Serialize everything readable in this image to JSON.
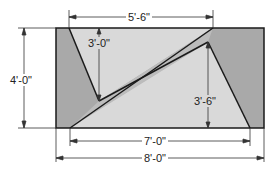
{
  "diagram": {
    "colors": {
      "dark_fill": "#a9a9a9",
      "light_fill": "#d9d9d9",
      "band_fill": "#bcbcbc",
      "line": "#1a1a1a",
      "dim_line": "#333333"
    },
    "dimensions": {
      "top_width": "5'-6\"",
      "left_height": "4'-0\"",
      "inner_left_height": "3'-0\"",
      "inner_right_height": "3'-6\"",
      "bottom_inner_width": "7'-0\"",
      "bottom_total_width": "8'-0\""
    }
  }
}
